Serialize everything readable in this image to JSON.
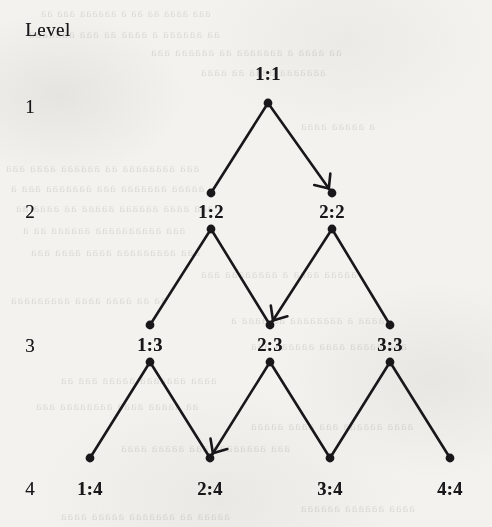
{
  "figure": {
    "kind": "binary-tree-diagram",
    "level_column_header": "Level",
    "level_numbers": [
      "1",
      "2",
      "3",
      "4"
    ],
    "ink_color": "#19171a",
    "paper_color": "#f3f2ef",
    "nodes": [
      {
        "id": "n11",
        "label": "1:1",
        "level": 1,
        "x": 268,
        "dot_y": 103,
        "label_y": 74,
        "label_pos": "above",
        "split_node": false
      },
      {
        "id": "n12",
        "label": "1:2",
        "level": 2,
        "x": 211,
        "dot_y": 193,
        "label_y": 212,
        "label_pos": "between",
        "split_node": true,
        "lower_dot_y": 229
      },
      {
        "id": "n22",
        "label": "2:2",
        "level": 2,
        "x": 332,
        "dot_y": 193,
        "label_y": 212,
        "label_pos": "between",
        "split_node": true,
        "lower_dot_y": 229
      },
      {
        "id": "n13",
        "label": "1:3",
        "level": 3,
        "x": 150,
        "dot_y": 325,
        "label_y": 345,
        "label_pos": "between",
        "split_node": true,
        "lower_dot_y": 362
      },
      {
        "id": "n23",
        "label": "2:3",
        "level": 3,
        "x": 270,
        "dot_y": 325,
        "label_y": 345,
        "label_pos": "between",
        "split_node": true,
        "lower_dot_y": 362
      },
      {
        "id": "n33",
        "label": "3:3",
        "level": 3,
        "x": 390,
        "dot_y": 325,
        "label_y": 345,
        "label_pos": "between",
        "split_node": true,
        "lower_dot_y": 362
      },
      {
        "id": "n14",
        "label": "1:4",
        "level": 4,
        "x": 90,
        "dot_y": 458,
        "label_y": 489,
        "label_pos": "below",
        "split_node": false
      },
      {
        "id": "n24",
        "label": "2:4",
        "level": 4,
        "x": 210,
        "dot_y": 458,
        "label_y": 489,
        "label_pos": "below",
        "split_node": false
      },
      {
        "id": "n34",
        "label": "3:4",
        "level": 4,
        "x": 330,
        "dot_y": 458,
        "label_y": 489,
        "label_pos": "below",
        "split_node": false
      },
      {
        "id": "n44",
        "label": "4:4",
        "level": 4,
        "x": 450,
        "dot_y": 458,
        "label_y": 489,
        "label_pos": "below",
        "split_node": false
      }
    ],
    "level_rows": [
      {
        "number": "1",
        "x": 30,
        "y": 107
      },
      {
        "number": "2",
        "x": 30,
        "y": 212
      },
      {
        "number": "3",
        "x": 30,
        "y": 346
      },
      {
        "number": "4",
        "x": 30,
        "y": 489
      }
    ],
    "header_pos": {
      "x": 48,
      "y": 30
    },
    "edges": [
      {
        "from": "n11",
        "to": "n12",
        "arrow": false
      },
      {
        "from": "n11",
        "to": "n22",
        "arrow": true,
        "arrow_dir": "down-right"
      },
      {
        "from": "n12",
        "to": "n13",
        "arrow": false
      },
      {
        "from": "n12",
        "to": "n23",
        "arrow": false
      },
      {
        "from": "n22",
        "to": "n23",
        "arrow": true,
        "arrow_dir": "down-left"
      },
      {
        "from": "n22",
        "to": "n33",
        "arrow": false
      },
      {
        "from": "n13",
        "to": "n14",
        "arrow": false
      },
      {
        "from": "n13",
        "to": "n24",
        "arrow": false
      },
      {
        "from": "n23",
        "to": "n24",
        "arrow": true,
        "arrow_dir": "down-left"
      },
      {
        "from": "n23",
        "to": "n34",
        "arrow": false
      },
      {
        "from": "n33",
        "to": "n34",
        "arrow": false
      },
      {
        "from": "n33",
        "to": "n44",
        "arrow": false
      }
    ],
    "highlighted_path": [
      "1:1",
      "2:2",
      "2:3",
      "2:4"
    ],
    "bleed_through_lines": [
      {
        "text": "aaa aaaa aa aa a aaaaaa aaa aa",
        "x": 40,
        "y": 6,
        "size": 12
      },
      {
        "text": "aa aaaaaa a aaaa aa aaa aaaaaaa",
        "x": 28,
        "y": 26,
        "size": 13
      },
      {
        "text": "aa aaaa a aaaaaaa aa aaaaaa aaa",
        "x": 150,
        "y": 44,
        "size": 13
      },
      {
        "text": "aaaaaaa aaaa aa aaaa",
        "x": 200,
        "y": 64,
        "size": 13
      },
      {
        "text": "a aaaaa aaaa",
        "x": 300,
        "y": 118,
        "size": 13
      },
      {
        "text": "aaa aaaaaaaa aa aaaaaa aaaa aaa",
        "x": 5,
        "y": 160,
        "size": 13
      },
      {
        "text": "aaaaa aaaaaaa aaa aaaaaaa aaa a",
        "x": 10,
        "y": 180,
        "size": 13
      },
      {
        "text": "aaa aaaa aaaaaa aaaaa aa aaaa aa",
        "x": 15,
        "y": 200,
        "size": 13
      },
      {
        "text": "aaa aaaaaaaaaa aaaaaa aa a",
        "x": 22,
        "y": 222,
        "size": 13
      },
      {
        "text": "aaa aaaaaaaaa aaaa aaaa aaa",
        "x": 30,
        "y": 244,
        "size": 13
      },
      {
        "text": "aaaaa aaaa a aaaaaaaa aaa",
        "x": 200,
        "y": 266,
        "size": 13
      },
      {
        "text": "aa aa aaaa aaaa aaaaaaaaa",
        "x": 10,
        "y": 292,
        "size": 13
      },
      {
        "text": "aaaa a aaaaaaaa aa aaaa a",
        "x": 230,
        "y": 312,
        "size": 13
      },
      {
        "text": "aaa aaaaa aaaa aaaaaa aaa",
        "x": 250,
        "y": 338,
        "size": 13
      },
      {
        "text": "aaaa aaaaaaa aaaaa aaa aa",
        "x": 60,
        "y": 372,
        "size": 13
      },
      {
        "text": "aa aaaaa aaaa aaaaaaaa aaa",
        "x": 35,
        "y": 398,
        "size": 13
      },
      {
        "text": "aaaa aaaaaa aaa aaaa aaaaa",
        "x": 250,
        "y": 418,
        "size": 13
      },
      {
        "text": "aaa aaaaaaaa aaa aaaaa aaaa",
        "x": 120,
        "y": 440,
        "size": 13
      },
      {
        "text": "aaaaa aa aaaaaaa aaaaa aaaa",
        "x": 60,
        "y": 508,
        "size": 13
      },
      {
        "text": "aaaa aaaaaa aaaaaa",
        "x": 300,
        "y": 500,
        "size": 13
      }
    ]
  }
}
